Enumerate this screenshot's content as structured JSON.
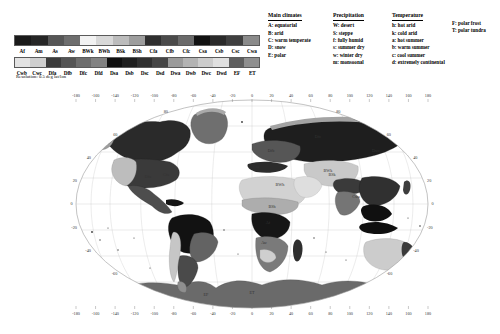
{
  "figure": {
    "resolution_note": "Resolution: 0.5 deg lat/lon",
    "projection": "elliptical world projection (Mollweide-like)"
  },
  "legend": {
    "row1_codes": [
      "Af",
      "Am",
      "As",
      "Aw",
      "BWk",
      "BWh",
      "BSk",
      "BSh",
      "Cfa",
      "Cfb",
      "Cfc",
      "Csa",
      "Csb",
      "Csc",
      "Cwa"
    ],
    "row2_codes": [
      "Cwb",
      "Cwc",
      "Dfa",
      "Dfb",
      "Dfc",
      "Dfd",
      "Dsa",
      "Dsb",
      "Dsc",
      "Dsd",
      "Dwa",
      "Dwb",
      "Dwc",
      "Dwd",
      "EF",
      "ET"
    ],
    "row1_colors": [
      "#1a1a1a",
      "#262626",
      "#565656",
      "#6e6e6e",
      "#f2f2f2",
      "#d8d8d8",
      "#bcbcbc",
      "#9d9d9d",
      "#2f2f2f",
      "#4a4a4a",
      "#6a6a6a",
      "#111111",
      "#2a2a2a",
      "#3f3f3f",
      "#8a8a8a",
      "#c3c3c3"
    ],
    "row2_colors": [
      "#e3e3e3",
      "#cfcfcf",
      "#3b3b3b",
      "#545454",
      "#6d6d6d",
      "#828282",
      "#101010",
      "#1f1f1f",
      "#303030",
      "#454545",
      "#9a9a9a",
      "#b3b3b3",
      "#cccccc",
      "#e0e0e0",
      "#5f5f5f",
      "#8f8f8f"
    ]
  },
  "main_climates": {
    "title": "Main climates",
    "entries": [
      "A: equatorial",
      "B: arid",
      "C: warm temperate",
      "D: snow",
      "E: polar"
    ]
  },
  "precipitation": {
    "title": "Precipitation",
    "entries": [
      "W: desert",
      "S: steppe",
      "f: fully humid",
      "s: summer dry",
      "w: winter dry",
      "m: monsoonal"
    ]
  },
  "temperature": {
    "title": "Temperature",
    "entries": [
      "h: hot arid",
      "k: cold arid",
      "a: hot summer",
      "b: warm summer",
      "c: cool summer",
      "d: extremely continental"
    ],
    "entries2": [
      "F: polar frost",
      "T: polar tundra"
    ]
  },
  "axes": {
    "lon_ticks": [
      "-180",
      "-160",
      "-140",
      "-120",
      "-100",
      "-80",
      "-60",
      "-40",
      "-20",
      "0",
      "20",
      "40",
      "60",
      "80",
      "100",
      "120",
      "140",
      "160",
      "180"
    ],
    "lat_ticks": [
      "-60",
      "-40",
      "-20",
      "0",
      "20",
      "40",
      "60",
      "80"
    ]
  },
  "map_labels": {
    "regions": [
      "ET",
      "EF",
      "Dfc",
      "Dfb",
      "Dfa",
      "BWh",
      "BSh",
      "Aw",
      "Af",
      "Cfa",
      "Cfb",
      "Csa",
      "BWk",
      "Dwc",
      "Cwa",
      "BSk"
    ]
  }
}
